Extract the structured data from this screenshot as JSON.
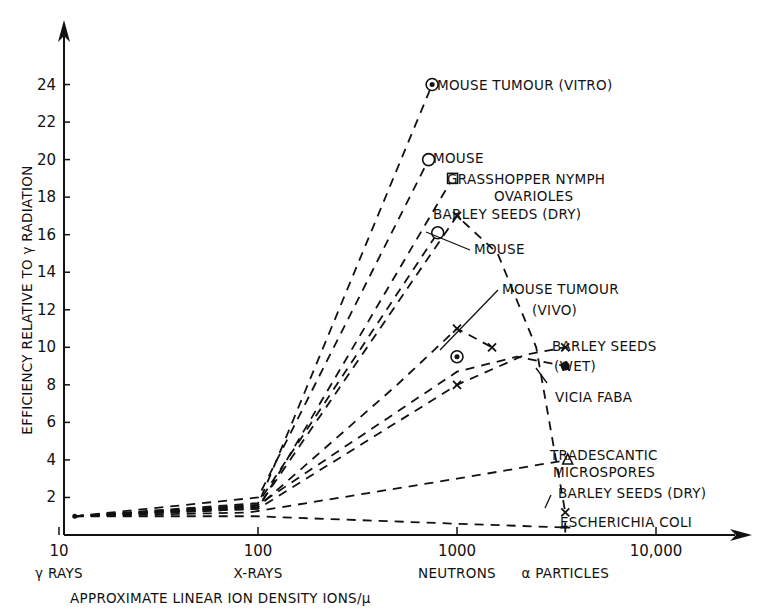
{
  "chart_data": {
    "type": "line",
    "title": "",
    "xlabel": "APPROXIMATE LINEAR ION DENSITY IONS/μ",
    "ylabel": "EFFICIENCY RELATIVE TO γ RADIATION",
    "xscale": "log",
    "xlim": [
      10,
      30000
    ],
    "ylim": [
      0,
      26
    ],
    "xticks": [
      {
        "value": 10,
        "label": "10",
        "sublabel": "γ RAYS"
      },
      {
        "value": 100,
        "label": "100",
        "sublabel": "X-RAYS"
      },
      {
        "value": 1000,
        "label": "1000",
        "sublabel": "NEUTRONS"
      },
      {
        "value": 10000,
        "label": "10,000",
        "sublabel": ""
      }
    ],
    "extra_x_label": {
      "value": 3500,
      "label": "α PARTICLES"
    },
    "yticks": [
      2,
      4,
      6,
      8,
      10,
      12,
      14,
      16,
      18,
      20,
      22,
      24
    ],
    "grid": false,
    "series": [
      {
        "name": "MOUSE TUMOUR (VITRO)",
        "marker": "double-circle",
        "points": [
          [
            12,
            1
          ],
          [
            100,
            1.6
          ],
          [
            750,
            24
          ]
        ],
        "label_at": [
          750,
          24
        ]
      },
      {
        "name": "MOUSE",
        "marker": "circle",
        "points": [
          [
            12,
            1
          ],
          [
            100,
            2
          ],
          [
            720,
            20
          ]
        ]
      },
      {
        "name": "GRASSHOPPER NYMPH OVARIOLES",
        "marker": "square",
        "points": [
          [
            12,
            1
          ],
          [
            100,
            1.4
          ],
          [
            950,
            19
          ]
        ]
      },
      {
        "name": "MOUSE (16)",
        "marker": "circle",
        "points": [
          [
            12,
            1
          ],
          [
            100,
            1.7
          ],
          [
            800,
            16.1
          ]
        ]
      },
      {
        "name": "BARLEY SEEDS (DRY)",
        "marker": "x",
        "points": [
          [
            12,
            1
          ],
          [
            100,
            1.5
          ],
          [
            1000,
            17
          ],
          [
            1600,
            15
          ],
          [
            2500,
            10
          ],
          [
            3500,
            1.2
          ]
        ]
      },
      {
        "name": "BARLEY SEEDS (11)",
        "marker": "x",
        "points": [
          [
            12,
            1
          ],
          [
            100,
            1.5
          ],
          [
            500,
            8
          ],
          [
            1000,
            11
          ],
          [
            1500,
            10
          ]
        ]
      },
      {
        "name": "MOUSE TUMOUR (VIVO)",
        "marker": "double-circle",
        "points": [
          [
            1000,
            9.5
          ]
        ]
      },
      {
        "name": "VICIA FABA",
        "marker": "dot",
        "points": [
          [
            12,
            1
          ],
          [
            100,
            1.6
          ],
          [
            1000,
            8.7
          ],
          [
            2000,
            9.5
          ],
          [
            3500,
            9
          ]
        ]
      },
      {
        "name": "BARLEY SEEDS (WET)",
        "marker": "x",
        "points": [
          [
            12,
            1
          ],
          [
            100,
            1.4
          ],
          [
            1000,
            8
          ],
          [
            2200,
            9.6
          ],
          [
            3500,
            10
          ]
        ]
      },
      {
        "name": "TRADESCANTIC MICROSPORES",
        "marker": "triangle",
        "points": [
          [
            12,
            1
          ],
          [
            90,
            1.2
          ],
          [
            1000,
            3
          ],
          [
            3600,
            4
          ]
        ]
      },
      {
        "name": "ESCHERICHIA COLI",
        "marker": "plus",
        "points": [
          [
            12,
            1
          ],
          [
            95,
            1
          ],
          [
            1000,
            0.6
          ],
          [
            3500,
            0.4
          ]
        ]
      }
    ],
    "annotations": [
      "MOUSE TUMOUR (VITRO)",
      "MOUSE",
      "GRASSHOPPER NYMPH",
      "OVARIOLES",
      "BARLEY SEEDS (DRY)",
      "MOUSE",
      "MOUSE TUMOUR",
      "(VIVO)",
      "BARLEY SEEDS",
      "(WET)",
      "VICIA FABA",
      "TRADESCANTIC",
      "MICROSPORES",
      "BARLEY SEEDS (DRY)",
      "ESCHERICHIA COLI"
    ]
  }
}
